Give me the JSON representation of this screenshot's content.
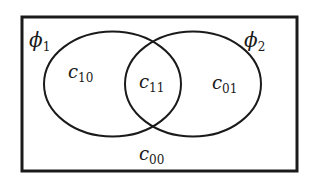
{
  "diagram": {
    "type": "venn",
    "universe": {
      "label": "c00",
      "main": "c",
      "sub": "00",
      "stroke_color": "#1a1a1a"
    },
    "sets": [
      {
        "name": "phi1",
        "main": "ϕ",
        "sub": "1"
      },
      {
        "name": "phi2",
        "main": "ϕ",
        "sub": "2"
      }
    ],
    "regions": [
      {
        "name": "c10",
        "main": "c",
        "sub": "10",
        "description": "in phi1 only"
      },
      {
        "name": "c11",
        "main": "c",
        "sub": "11",
        "description": "in phi1 and phi2"
      },
      {
        "name": "c01",
        "main": "c",
        "sub": "01",
        "description": "in phi2 only"
      },
      {
        "name": "c00",
        "main": "c",
        "sub": "00",
        "description": "in neither"
      }
    ],
    "colors": {
      "background": "#ffffff",
      "ink": "#1a1a1a"
    }
  }
}
